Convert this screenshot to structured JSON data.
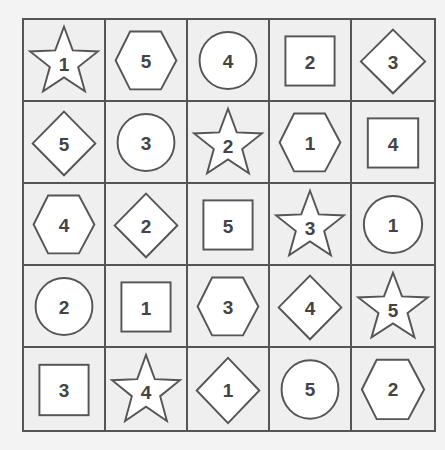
{
  "puzzle": {
    "rows": 5,
    "cols": 5,
    "colors": {
      "background": "#f3f3f3",
      "cell_fill": "#efefef",
      "grid_line": "#555555",
      "shape_fill": "#ffffff",
      "shape_stroke": "#555555",
      "number": "#444444"
    },
    "cells": [
      [
        {
          "shape": "star",
          "number": "1"
        },
        {
          "shape": "hexagon",
          "number": "5"
        },
        {
          "shape": "circle",
          "number": "4"
        },
        {
          "shape": "square",
          "number": "2"
        },
        {
          "shape": "diamond",
          "number": "3"
        }
      ],
      [
        {
          "shape": "diamond",
          "number": "5"
        },
        {
          "shape": "circle",
          "number": "3"
        },
        {
          "shape": "star",
          "number": "2"
        },
        {
          "shape": "hexagon",
          "number": "1"
        },
        {
          "shape": "square",
          "number": "4"
        }
      ],
      [
        {
          "shape": "hexagon",
          "number": "4"
        },
        {
          "shape": "diamond",
          "number": "2"
        },
        {
          "shape": "square",
          "number": "5"
        },
        {
          "shape": "star",
          "number": "3"
        },
        {
          "shape": "circle",
          "number": "1"
        }
      ],
      [
        {
          "shape": "circle",
          "number": "2"
        },
        {
          "shape": "square",
          "number": "1"
        },
        {
          "shape": "hexagon",
          "number": "3"
        },
        {
          "shape": "diamond",
          "number": "4"
        },
        {
          "shape": "star",
          "number": "5"
        }
      ],
      [
        {
          "shape": "square",
          "number": "3"
        },
        {
          "shape": "star",
          "number": "4"
        },
        {
          "shape": "diamond",
          "number": "1"
        },
        {
          "shape": "circle",
          "number": "5"
        },
        {
          "shape": "hexagon",
          "number": "2"
        }
      ]
    ]
  }
}
